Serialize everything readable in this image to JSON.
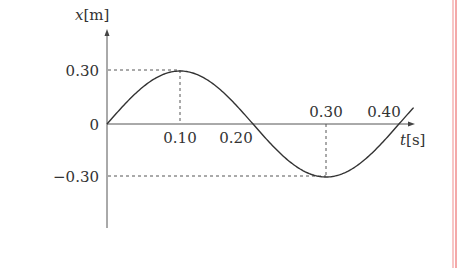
{
  "chart_data": {
    "type": "line",
    "title": "",
    "xlabel": "t[s]",
    "ylabel": "x[m]",
    "xlabel_var": "t",
    "xlabel_unit": "[s]",
    "ylabel_var": "x",
    "ylabel_unit": "[m]",
    "function": "x = 0.30 sin(2πt / 0.40)",
    "amplitude": 0.3,
    "period": 0.4,
    "x": [
      0,
      0.05,
      0.1,
      0.15,
      0.2,
      0.25,
      0.3,
      0.35,
      0.4,
      0.42
    ],
    "series": [
      {
        "name": "x(t)",
        "values": [
          0,
          0.212,
          0.3,
          0.212,
          0,
          -0.212,
          -0.3,
          -0.212,
          0,
          0.047
        ]
      }
    ],
    "x_tick_labels": [
      "0.10",
      "0.20",
      "0.30",
      "0.40"
    ],
    "y_tick_labels": [
      "0.30",
      "0",
      "-0.30"
    ],
    "xlim": [
      0,
      0.42
    ],
    "ylim": [
      -0.45,
      0.45
    ],
    "grid": false,
    "legend": "none",
    "annotations": [
      "dashed guide at x=0.30 from t=0 to t=0.10",
      "dashed guide at t=0.10",
      "dashed guide at x=-0.30 from t=0 to t=0.30",
      "dashed guide at t=0.30"
    ]
  },
  "labels": {
    "y_axis_var": "x",
    "y_axis_unit": "[m]",
    "x_axis_var": "t",
    "x_axis_unit": "[s]",
    "y_top": "0.30",
    "y_zero": "0",
    "y_bottom": "−0.30",
    "x_010": "0.10",
    "x_020": "0.20",
    "x_030": "0.30",
    "x_040": "0.40"
  },
  "colors": {
    "curve": "#333333",
    "axis": "#555555",
    "margin_line": "#f0a0a0"
  }
}
